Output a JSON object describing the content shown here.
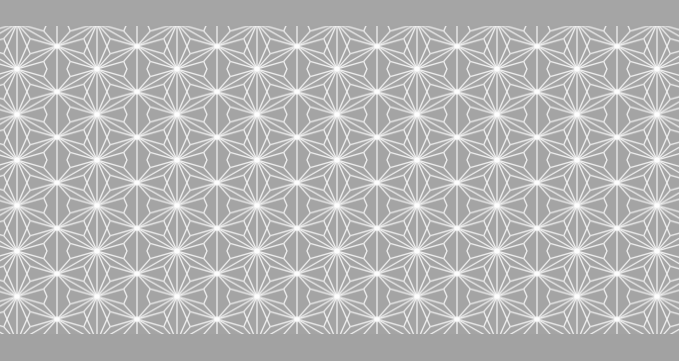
{
  "image": {
    "subject": "asanoha (hemp leaf) geometric pattern on grey fabric",
    "colors": {
      "background": "#a4a4a4",
      "line": "#f2f2f2",
      "star_glow": "#ffffff"
    },
    "pattern": {
      "period_x": 80,
      "row_height": 45.5,
      "offset_x": 17,
      "offset_y": 46
    }
  }
}
